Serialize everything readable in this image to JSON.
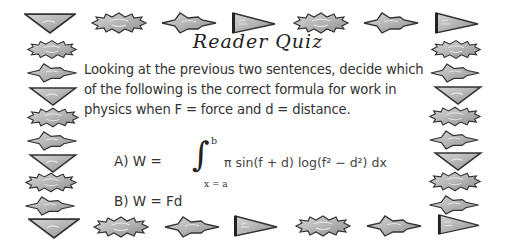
{
  "quiz": {
    "title": "Reader Quiz",
    "question_lines": [
      "Looking at the previous two sentences, decide which",
      "of the following is the correct formula for work in",
      "physics when F = force and d = distance."
    ],
    "option_a": {
      "label": "A) W =",
      "integral_symbol": "∫",
      "upper_bound": "b",
      "lower_bound": "x = a",
      "expression": "π sin(f + d) log(f² − d²) dx"
    },
    "option_b": {
      "label": "B) W = Fd"
    }
  },
  "border": {
    "icons": [
      "down-triangle-icon",
      "burst-icon",
      "star-icon",
      "pennant-icon"
    ],
    "colors": {
      "fill": "#b8b8b8",
      "stroke": "#3a3a3a",
      "highlight": "#dcdcdc"
    }
  }
}
